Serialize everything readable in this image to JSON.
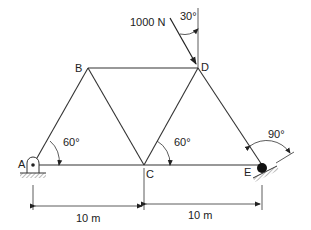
{
  "diagram": {
    "type": "truss",
    "joints": {
      "A": {
        "label": "A",
        "x": 33,
        "y": 165,
        "support": "pin"
      },
      "B": {
        "label": "B",
        "x": 88,
        "y": 68
      },
      "C": {
        "label": "C",
        "x": 144,
        "y": 165
      },
      "D": {
        "label": "D",
        "x": 198,
        "y": 68
      },
      "E": {
        "label": "E",
        "x": 262,
        "y": 165,
        "support": "roller-inclined"
      }
    },
    "members": [
      "AB",
      "AC",
      "BC",
      "BD",
      "CD",
      "CE",
      "DE"
    ],
    "load": {
      "label": "1000 N",
      "at": "D",
      "angle_label": "30°"
    },
    "angles": {
      "at_A": "60°",
      "at_C": "60°",
      "at_E": "90°"
    },
    "dimensions": [
      {
        "label": "10 m",
        "from": "A",
        "to": "C"
      },
      {
        "label": "10 m",
        "from": "C",
        "to": "E"
      }
    ]
  }
}
